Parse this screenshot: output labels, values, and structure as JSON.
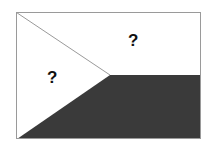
{
  "diagram": {
    "type": "flag-outline",
    "colors": {
      "background": "#ffffff",
      "dark_region": "#3a3a3a",
      "border": "#9a9a9a"
    },
    "regions": [
      {
        "id": "top-stripe",
        "label": "?"
      },
      {
        "id": "left-triangle",
        "label": "?"
      },
      {
        "id": "bottom-stripe",
        "label": ""
      }
    ]
  }
}
